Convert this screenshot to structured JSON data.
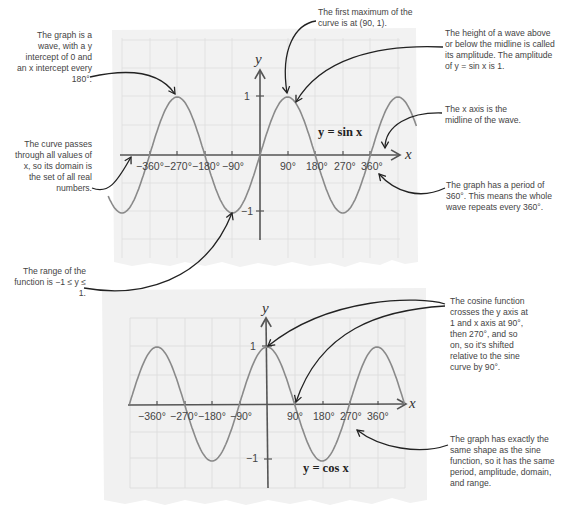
{
  "chart_data": [
    {
      "type": "line",
      "title": "y = sin x",
      "xlabel": "x",
      "ylabel": "y",
      "xticks": [
        "-360°",
        "-270°",
        "-180°",
        "-90°",
        "90°",
        "180°",
        "270°",
        "360°"
      ],
      "yticks": [
        "1",
        "-1"
      ],
      "xlim": [
        -495,
        510
      ],
      "ylim": [
        -1.2,
        1.2
      ],
      "grid": true,
      "function": "sin",
      "x": [
        -450,
        -360,
        -270,
        -180,
        -90,
        0,
        90,
        180,
        270,
        360,
        450
      ],
      "values": [
        -1,
        0,
        1,
        0,
        -1,
        0,
        1,
        0,
        -1,
        0,
        1
      ]
    },
    {
      "type": "line",
      "title": "y = cos x",
      "xlabel": "x",
      "ylabel": "y",
      "xticks": [
        "-360°",
        "-270°",
        "-180°",
        "-90°",
        "90°",
        "180°",
        "270°",
        "360°"
      ],
      "yticks": [
        "1",
        "-1"
      ],
      "xlim": [
        -450,
        450
      ],
      "ylim": [
        -1.2,
        1.2
      ],
      "grid": true,
      "function": "cos",
      "x": [
        -450,
        -360,
        -270,
        -180,
        -90,
        0,
        90,
        180,
        270,
        360,
        450
      ],
      "values": [
        0,
        1,
        0,
        -1,
        0,
        1,
        0,
        -1,
        0,
        1,
        0
      ]
    }
  ],
  "sine_graph": {
    "equation": "y = sin x",
    "axis_x": "x",
    "axis_y": "y",
    "y_tick_pos": "1",
    "y_tick_neg": "−1",
    "x_ticks": [
      "−360°",
      "−270°",
      "−180°",
      "−90°",
      "90°",
      "180°",
      "270°",
      "360°"
    ]
  },
  "cosine_graph": {
    "equation": "y = cos x",
    "axis_x": "x",
    "axis_y": "y",
    "y_tick_pos": "1",
    "y_tick_neg": "−1",
    "x_ticks": [
      "−360°",
      "−270°",
      "−180°",
      "−90°",
      "90°",
      "180°",
      "270°",
      "360°"
    ]
  },
  "annotations": {
    "sine_wave_intercepts": "The graph is a wave, with a y intercept of 0 and an x intercept every 180°.",
    "sine_domain": "The curve passes through all values of x, so its domain is the set of all real numbers.",
    "sine_range": "The range of the function is −1 ≤ y ≤ 1.",
    "sine_first_max": "The first maximum of the curve is at (90, 1).",
    "sine_amplitude": "The height of a wave above or below the midline is called its amplitude. The amplitude of y = sin x is 1.",
    "sine_midline": "The x axis is the midline of the wave.",
    "sine_period": "The graph has a period of 360°. This means the whole wave repeats every 360°.",
    "cosine_shift": "The cosine function crosses the y axis at 1 and x axis at 90°, then 270°, and so on, so it's shifted relative to the sine curve by 90°.",
    "cosine_same_shape": "The graph has exactly the same shape as the sine function, so it has the same period, amplitude, domain, and range."
  },
  "colors": {
    "paper": "#f1f1f1",
    "grid": "#dddddd",
    "curve": "#8a8a8a",
    "axis": "#555555",
    "arrow": "#222222",
    "text": "#444444"
  }
}
